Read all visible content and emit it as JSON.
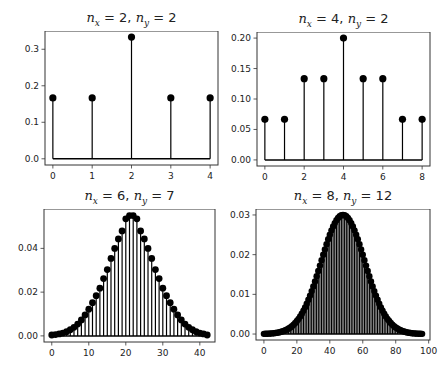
{
  "chart_data": [
    {
      "type": "stem",
      "title": "n_x = 2, n_y = 2",
      "title_parts": {
        "a": "x",
        "av": "2",
        "b": "y",
        "bv": "2"
      },
      "x": [
        0,
        1,
        2,
        3,
        4
      ],
      "values": [
        0.1667,
        0.1667,
        0.3333,
        0.1667,
        0.1667
      ],
      "xticks": [
        "0",
        "1",
        "2",
        "3",
        "4"
      ],
      "yticks": [
        "0.0",
        "0.1",
        "0.2",
        "0.3"
      ],
      "xlim": [
        -0.2,
        4.2
      ],
      "ylim": [
        -0.017,
        0.35
      ],
      "grid": false
    },
    {
      "type": "stem",
      "title": "n_x = 4, n_y = 2",
      "title_parts": {
        "a": "x",
        "av": "4",
        "b": "y",
        "bv": "2"
      },
      "x": [
        0,
        1,
        2,
        3,
        4,
        5,
        6,
        7,
        8
      ],
      "values": [
        0.0667,
        0.0667,
        0.1333,
        0.1333,
        0.2,
        0.1333,
        0.1333,
        0.0667,
        0.0667
      ],
      "xticks": [
        "0",
        "2",
        "4",
        "6",
        "8"
      ],
      "yticks": [
        "0.00",
        "0.05",
        "0.10",
        "0.15",
        "0.20"
      ],
      "xlim": [
        -0.4,
        8.4
      ],
      "ylim": [
        -0.01,
        0.21
      ],
      "grid": false
    },
    {
      "type": "stem",
      "title": "n_x = 6, n_y = 7",
      "title_parts": {
        "a": "x",
        "av": "6",
        "b": "y",
        "bv": "7"
      },
      "x_range": [
        0,
        42
      ],
      "peak": {
        "x": 21,
        "y": 0.055
      },
      "values": [
        0.0004,
        0.0006,
        0.0009,
        0.0013,
        0.0019,
        0.0028,
        0.0039,
        0.0054,
        0.0073,
        0.0096,
        0.0122,
        0.0152,
        0.0184,
        0.0218,
        0.0262,
        0.0303,
        0.0354,
        0.04,
        0.0443,
        0.048,
        0.0535,
        0.055,
        0.055,
        0.0535,
        0.048,
        0.0443,
        0.04,
        0.0354,
        0.0303,
        0.0262,
        0.0218,
        0.0184,
        0.0152,
        0.0122,
        0.0096,
        0.0073,
        0.0054,
        0.0039,
        0.0028,
        0.0019,
        0.0013,
        0.0009,
        0.0004
      ],
      "xticks": [
        "0",
        "10",
        "20",
        "30",
        "40"
      ],
      "yticks": [
        "0.00",
        "0.02",
        "0.04"
      ],
      "xlim": [
        -2.1,
        44.1
      ],
      "ylim": [
        -0.0028,
        0.058
      ],
      "grid": false
    },
    {
      "type": "stem",
      "title": "n_x = 8, n_y = 12",
      "title_parts": {
        "a": "x",
        "av": "8",
        "b": "y",
        "bv": "12"
      },
      "x_range": [
        0,
        96
      ],
      "peak": {
        "x": 48,
        "y": 0.03
      },
      "sigma": 13.3,
      "xticks": [
        "0",
        "20",
        "40",
        "60",
        "80",
        "100"
      ],
      "yticks": [
        "0.00",
        "0.01",
        "0.02",
        "0.03"
      ],
      "xlim": [
        -4.8,
        100.8
      ],
      "ylim": [
        -0.0015,
        0.0315
      ],
      "grid": false
    }
  ]
}
